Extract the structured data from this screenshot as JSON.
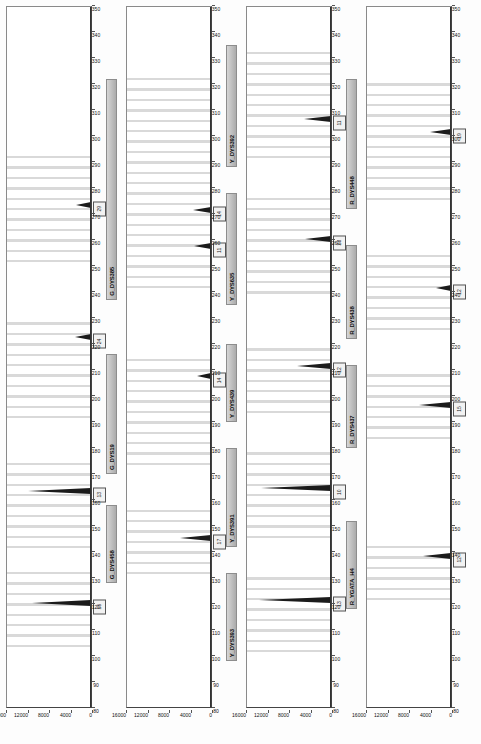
{
  "document": {
    "title": "Y-STR Electropherogram Panel Display",
    "orientation": "rotated-90",
    "panel_count": 4
  },
  "axis": {
    "x_label": "Size (bp)",
    "x_ticks": [
      80,
      90,
      100,
      110,
      120,
      130,
      140,
      150,
      160,
      170,
      180,
      190,
      200,
      210,
      220,
      230,
      240,
      250,
      260,
      270,
      280,
      290,
      300,
      310,
      320,
      330,
      340,
      350
    ],
    "x_min": 80,
    "x_max": 350,
    "y_label": "RFU",
    "y_ticks": [
      "16000",
      "12000",
      "8000",
      "4000",
      "0"
    ],
    "y_min": 0,
    "y_max": 16000
  },
  "panels": [
    {
      "id": "panel-blue",
      "dye": "B",
      "markers": [
        {
          "label": "B_DYS456",
          "start": 103,
          "end": 130
        },
        {
          "label": "B_DYS389I",
          "start": 138,
          "end": 175
        },
        {
          "label": "B_DYS390",
          "start": 186,
          "end": 228
        },
        {
          "label": "B_DYS389II",
          "start": 248,
          "end": 292
        }
      ],
      "bins": [
        103,
        107,
        111,
        115,
        119,
        123,
        127,
        131,
        141,
        145,
        149,
        153,
        157,
        161,
        165,
        169,
        173,
        191,
        195,
        199,
        203,
        207,
        211,
        215,
        219,
        223,
        227,
        251,
        255,
        259,
        263,
        267,
        271,
        275,
        279,
        283,
        287,
        291
      ],
      "peaks": [
        {
          "size": 119,
          "height": 11600,
          "allele": "15"
        },
        {
          "size": 162,
          "height": 12400,
          "allele": "13"
        },
        {
          "size": 221,
          "height": 3200,
          "allele": "24"
        },
        {
          "size": 272,
          "height": 3000,
          "allele": "29"
        }
      ]
    },
    {
      "id": "panel-green",
      "dye": "G",
      "markers": [
        {
          "label": "G_DYS458",
          "start": 128,
          "end": 158
        },
        {
          "label": "G_DYS19",
          "start": 170,
          "end": 216
        },
        {
          "label": "G_DYS385",
          "start": 237,
          "end": 322
        }
      ],
      "bins": [
        131,
        135,
        139,
        143,
        147,
        151,
        155,
        173,
        177,
        181,
        185,
        189,
        193,
        197,
        201,
        205,
        209,
        213,
        241,
        245,
        249,
        253,
        257,
        261,
        265,
        269,
        273,
        277,
        281,
        285,
        289,
        293,
        297,
        301,
        305,
        309,
        313,
        317,
        321
      ],
      "peaks": [
        {
          "size": 144,
          "height": 6200,
          "allele": "17"
        },
        {
          "size": 206,
          "height": 2800,
          "allele": "14"
        },
        {
          "size": 256,
          "height": 3400,
          "allele": "11"
        },
        {
          "size": 270,
          "height": 3600,
          "allele": "14"
        }
      ]
    },
    {
      "id": "panel-yellow",
      "dye": "Y",
      "markers": [
        {
          "label": "Y_DYS393",
          "start": 98,
          "end": 132
        },
        {
          "label": "Y_DYS391",
          "start": 142,
          "end": 180
        },
        {
          "label": "Y_DYS439",
          "start": 190,
          "end": 220
        },
        {
          "label": "Y_DYS635",
          "start": 235,
          "end": 278
        },
        {
          "label": "Y_DYS392",
          "start": 288,
          "end": 335
        }
      ],
      "bins": [
        101,
        105,
        109,
        113,
        117,
        121,
        125,
        129,
        145,
        149,
        153,
        157,
        161,
        165,
        169,
        173,
        177,
        193,
        197,
        201,
        205,
        209,
        213,
        217,
        239,
        243,
        247,
        251,
        255,
        259,
        263,
        267,
        271,
        275,
        291,
        295,
        299,
        303,
        307,
        311,
        315,
        319,
        323,
        327,
        331
      ],
      "peaks": [
        {
          "size": 120,
          "height": 14200,
          "allele": "13"
        },
        {
          "size": 163,
          "height": 13800,
          "allele": "10"
        },
        {
          "size": 210,
          "height": 6800,
          "allele": "12"
        },
        {
          "size": 259,
          "height": 5200,
          "allele": "23"
        },
        {
          "size": 305,
          "height": 5400,
          "allele": "11"
        }
      ]
    },
    {
      "id": "panel-red",
      "dye": "R",
      "markers": [
        {
          "label": "R_YGATA_H4",
          "start": 118,
          "end": 152
        },
        {
          "label": "R_DYS437",
          "start": 180,
          "end": 212
        },
        {
          "label": "R_DYS438",
          "start": 222,
          "end": 258
        },
        {
          "label": "R_DYS448",
          "start": 272,
          "end": 322
        }
      ],
      "bins": [
        121,
        125,
        129,
        133,
        137,
        141,
        183,
        187,
        191,
        195,
        199,
        203,
        207,
        225,
        229,
        233,
        237,
        241,
        245,
        249,
        253,
        275,
        279,
        283,
        287,
        291,
        295,
        299,
        303,
        307,
        311,
        315,
        319
      ],
      "peaks": [
        {
          "size": 137,
          "height": 5600,
          "allele": "12"
        },
        {
          "size": 195,
          "height": 6400,
          "allele": "15"
        },
        {
          "size": 240,
          "height": 3000,
          "allele": "12"
        },
        {
          "size": 300,
          "height": 4200,
          "allele": "19"
        }
      ]
    }
  ],
  "colors": {
    "blue_dye": "#2a3fa0",
    "green_dye": "#1f7a2e",
    "yellow_dye": "#b89600",
    "red_dye": "#a02020",
    "bin_band": "#b9b9b9",
    "peak": "#111111",
    "frame": "#444444"
  }
}
